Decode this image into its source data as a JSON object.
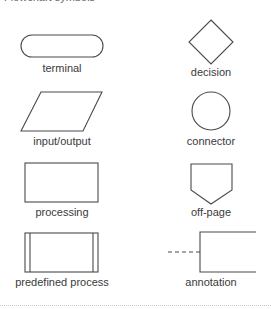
{
  "header": {
    "title": "Flowchart symbols"
  },
  "symbols": [
    {
      "name": "terminal",
      "label": "terminal"
    },
    {
      "name": "decision",
      "label": "decision"
    },
    {
      "name": "input-output",
      "label": "input/output"
    },
    {
      "name": "connector",
      "label": "connector"
    },
    {
      "name": "processing",
      "label": "processing"
    },
    {
      "name": "off-page",
      "label": "off-page"
    },
    {
      "name": "predefined-process",
      "label": "predefined process"
    },
    {
      "name": "annotation",
      "label": "annotation"
    }
  ],
  "colors": {
    "stroke": "#4a4a4a",
    "text": "#3a3a3a",
    "divider": "#c8c8c8"
  }
}
